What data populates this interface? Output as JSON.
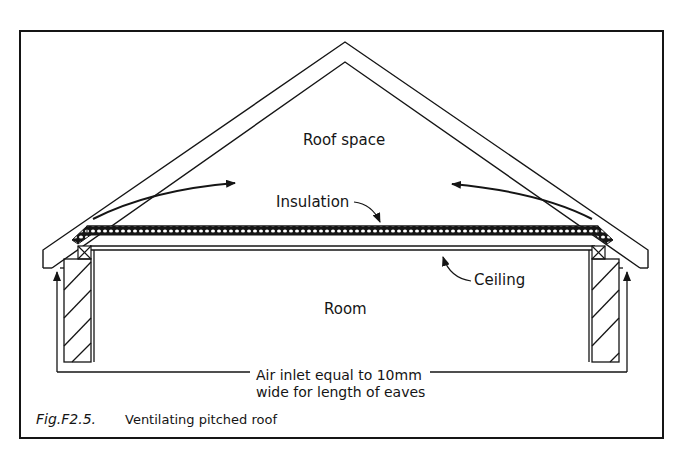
{
  "figure": {
    "number": "Fig.F2.5.",
    "caption": "Ventilating pitched roof"
  },
  "labels": {
    "roof_space": "Roof space",
    "insulation": "Insulation",
    "ceiling": "Ceiling",
    "room": "Room",
    "air_inlet_line1": "Air inlet equal to 10mm",
    "air_inlet_line2": "wide for length of eaves"
  },
  "colors": {
    "ink": "#151515",
    "background": "#ffffff"
  }
}
